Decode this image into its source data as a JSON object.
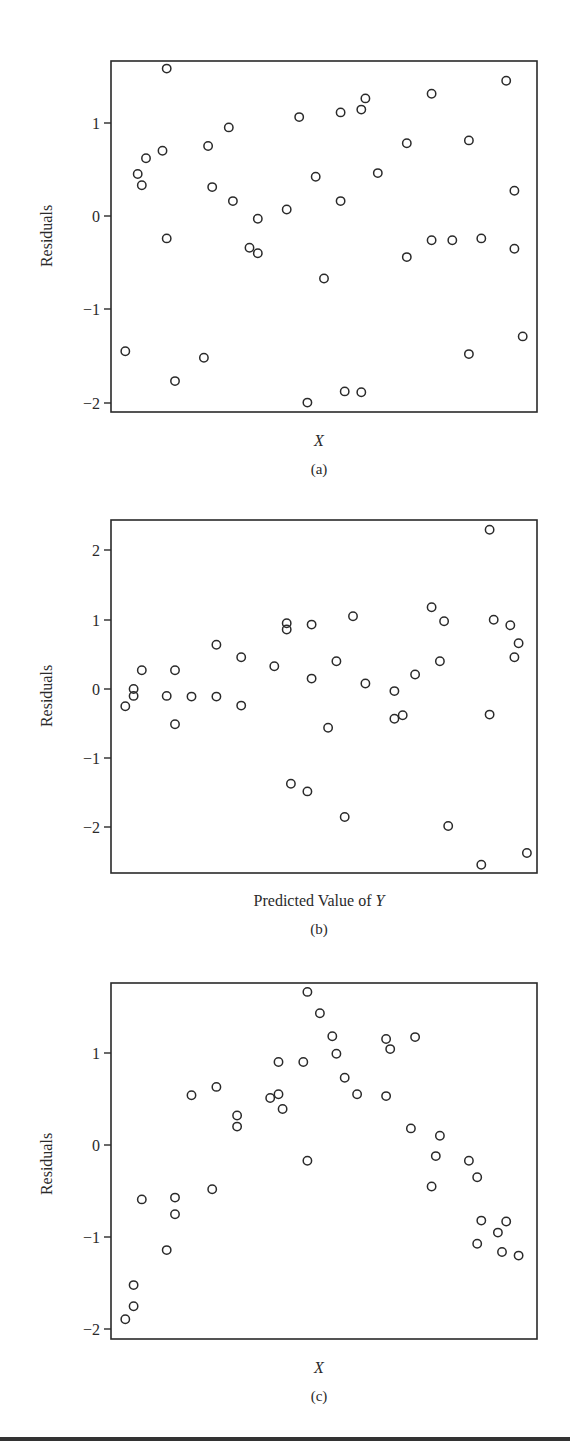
{
  "chart_data": [
    {
      "id": "a",
      "type": "scatter",
      "title": "",
      "caption": "(a)",
      "xlabel": "X",
      "xlabel_italic": true,
      "ylabel": "Residuals",
      "ylim": [
        -2.1,
        1.65
      ],
      "yticks": [
        1,
        0,
        -1,
        -2
      ],
      "ytick_labels": [
        "1",
        "0",
        "−1",
        "−2"
      ],
      "grid": false,
      "legend": null,
      "marker": "open-circle",
      "points": [
        {
          "x": 0.02,
          "y": -1.45
        },
        {
          "x": 0.05,
          "y": 0.45
        },
        {
          "x": 0.06,
          "y": 0.33
        },
        {
          "x": 0.07,
          "y": 0.62
        },
        {
          "x": 0.11,
          "y": 0.7
        },
        {
          "x": 0.12,
          "y": 1.58
        },
        {
          "x": 0.12,
          "y": -0.24
        },
        {
          "x": 0.14,
          "y": -1.77
        },
        {
          "x": 0.21,
          "y": -1.52
        },
        {
          "x": 0.22,
          "y": 0.75
        },
        {
          "x": 0.23,
          "y": 0.31
        },
        {
          "x": 0.27,
          "y": 0.95
        },
        {
          "x": 0.28,
          "y": 0.16
        },
        {
          "x": 0.32,
          "y": -0.34
        },
        {
          "x": 0.34,
          "y": -0.03
        },
        {
          "x": 0.34,
          "y": -0.4
        },
        {
          "x": 0.41,
          "y": 0.07
        },
        {
          "x": 0.44,
          "y": 1.06
        },
        {
          "x": 0.46,
          "y": -2.0
        },
        {
          "x": 0.48,
          "y": 0.42
        },
        {
          "x": 0.5,
          "y": -0.67
        },
        {
          "x": 0.54,
          "y": 1.11
        },
        {
          "x": 0.54,
          "y": 0.16
        },
        {
          "x": 0.55,
          "y": -1.88
        },
        {
          "x": 0.59,
          "y": -1.89
        },
        {
          "x": 0.59,
          "y": 1.14
        },
        {
          "x": 0.6,
          "y": 1.26
        },
        {
          "x": 0.63,
          "y": 0.46
        },
        {
          "x": 0.7,
          "y": 0.78
        },
        {
          "x": 0.7,
          "y": -0.44
        },
        {
          "x": 0.76,
          "y": 1.31
        },
        {
          "x": 0.76,
          "y": -0.26
        },
        {
          "x": 0.81,
          "y": -0.26
        },
        {
          "x": 0.85,
          "y": 0.81
        },
        {
          "x": 0.85,
          "y": -1.48
        },
        {
          "x": 0.88,
          "y": -0.24
        },
        {
          "x": 0.94,
          "y": 1.45
        },
        {
          "x": 0.96,
          "y": 0.27
        },
        {
          "x": 0.96,
          "y": -0.35
        },
        {
          "x": 0.98,
          "y": -1.29
        }
      ]
    },
    {
      "id": "b",
      "type": "scatter",
      "title": "",
      "caption": "(b)",
      "xlabel": "Predicted Value of Y",
      "xlabel_parts": [
        "Predicted Value of ",
        "Y"
      ],
      "ylabel": "Residuals",
      "ylim": [
        -2.65,
        2.4
      ],
      "yticks": [
        2,
        1,
        0,
        -1,
        -2
      ],
      "ytick_labels": [
        "2",
        "1",
        "0",
        "−1",
        "−2"
      ],
      "grid": false,
      "legend": null,
      "marker": "open-circle",
      "points": [
        {
          "x": 0.02,
          "y": -0.25
        },
        {
          "x": 0.04,
          "y": 0.0
        },
        {
          "x": 0.04,
          "y": -0.1
        },
        {
          "x": 0.06,
          "y": 0.27
        },
        {
          "x": 0.12,
          "y": -0.1
        },
        {
          "x": 0.14,
          "y": 0.27
        },
        {
          "x": 0.14,
          "y": -0.51
        },
        {
          "x": 0.18,
          "y": -0.11
        },
        {
          "x": 0.24,
          "y": 0.64
        },
        {
          "x": 0.24,
          "y": -0.11
        },
        {
          "x": 0.3,
          "y": 0.46
        },
        {
          "x": 0.3,
          "y": -0.24
        },
        {
          "x": 0.38,
          "y": 0.33
        },
        {
          "x": 0.41,
          "y": 0.95
        },
        {
          "x": 0.41,
          "y": 0.86
        },
        {
          "x": 0.42,
          "y": -1.37
        },
        {
          "x": 0.46,
          "y": -1.48
        },
        {
          "x": 0.47,
          "y": 0.93
        },
        {
          "x": 0.47,
          "y": 0.15
        },
        {
          "x": 0.51,
          "y": -0.56
        },
        {
          "x": 0.53,
          "y": 0.4
        },
        {
          "x": 0.55,
          "y": -1.85
        },
        {
          "x": 0.57,
          "y": 1.05
        },
        {
          "x": 0.6,
          "y": 0.08
        },
        {
          "x": 0.67,
          "y": -0.03
        },
        {
          "x": 0.67,
          "y": -0.43
        },
        {
          "x": 0.69,
          "y": -0.38
        },
        {
          "x": 0.72,
          "y": 0.21
        },
        {
          "x": 0.76,
          "y": 1.18
        },
        {
          "x": 0.78,
          "y": 0.4
        },
        {
          "x": 0.79,
          "y": 0.98
        },
        {
          "x": 0.8,
          "y": -1.98
        },
        {
          "x": 0.88,
          "y": -2.54
        },
        {
          "x": 0.9,
          "y": 2.3
        },
        {
          "x": 0.9,
          "y": -0.37
        },
        {
          "x": 0.91,
          "y": 1.0
        },
        {
          "x": 0.95,
          "y": 0.92
        },
        {
          "x": 0.96,
          "y": 0.46
        },
        {
          "x": 0.97,
          "y": 0.66
        },
        {
          "x": 0.99,
          "y": -2.37
        }
      ]
    },
    {
      "id": "c",
      "type": "scatter",
      "title": "",
      "caption": "(c)",
      "xlabel": "X",
      "xlabel_italic": true,
      "ylabel": "Residuals",
      "ylim": [
        -2.1,
        1.75
      ],
      "yticks": [
        1,
        0,
        -1,
        -2
      ],
      "ytick_labels": [
        "1",
        "0",
        "−1",
        "−2"
      ],
      "grid": false,
      "legend": null,
      "marker": "open-circle",
      "points": [
        {
          "x": 0.02,
          "y": -1.89
        },
        {
          "x": 0.04,
          "y": -1.75
        },
        {
          "x": 0.04,
          "y": -1.52
        },
        {
          "x": 0.06,
          "y": -0.59
        },
        {
          "x": 0.12,
          "y": -1.14
        },
        {
          "x": 0.14,
          "y": -0.75
        },
        {
          "x": 0.14,
          "y": -0.57
        },
        {
          "x": 0.18,
          "y": 0.54
        },
        {
          "x": 0.23,
          "y": -0.48
        },
        {
          "x": 0.24,
          "y": 0.63
        },
        {
          "x": 0.29,
          "y": 0.32
        },
        {
          "x": 0.29,
          "y": 0.2
        },
        {
          "x": 0.37,
          "y": 0.51
        },
        {
          "x": 0.39,
          "y": 0.9
        },
        {
          "x": 0.39,
          "y": 0.55
        },
        {
          "x": 0.4,
          "y": 0.39
        },
        {
          "x": 0.45,
          "y": 0.9
        },
        {
          "x": 0.46,
          "y": 1.66
        },
        {
          "x": 0.46,
          "y": -0.17
        },
        {
          "x": 0.49,
          "y": 1.43
        },
        {
          "x": 0.52,
          "y": 1.18
        },
        {
          "x": 0.53,
          "y": 0.99
        },
        {
          "x": 0.55,
          "y": 0.73
        },
        {
          "x": 0.58,
          "y": 0.55
        },
        {
          "x": 0.65,
          "y": 1.15
        },
        {
          "x": 0.65,
          "y": 0.53
        },
        {
          "x": 0.66,
          "y": 1.04
        },
        {
          "x": 0.72,
          "y": 1.17
        },
        {
          "x": 0.71,
          "y": 0.18
        },
        {
          "x": 0.76,
          "y": -0.45
        },
        {
          "x": 0.77,
          "y": -0.12
        },
        {
          "x": 0.78,
          "y": 0.1
        },
        {
          "x": 0.85,
          "y": -0.17
        },
        {
          "x": 0.87,
          "y": -0.35
        },
        {
          "x": 0.87,
          "y": -1.07
        },
        {
          "x": 0.88,
          "y": -0.82
        },
        {
          "x": 0.92,
          "y": -0.95
        },
        {
          "x": 0.93,
          "y": -1.16
        },
        {
          "x": 0.94,
          "y": -0.83
        },
        {
          "x": 0.97,
          "y": -1.2
        }
      ]
    }
  ],
  "panels": {
    "a": {
      "caption": "(a)",
      "xlabel": "X",
      "ylabel": "Residuals",
      "ticks": [
        "1",
        "0",
        "−1",
        "−2"
      ]
    },
    "b": {
      "caption": "(b)",
      "xlabel_prefix": "Predicted Value of ",
      "xlabel_var": "Y",
      "ylabel": "Residuals",
      "ticks": [
        "2",
        "1",
        "0",
        "−1",
        "−2"
      ]
    },
    "c": {
      "caption": "(c)",
      "xlabel": "X",
      "ylabel": "Residuals",
      "ticks": [
        "1",
        "0",
        "−1",
        "−2"
      ]
    }
  },
  "colors": {
    "ink": "#2a2a2a",
    "background": "#ffffff",
    "rule": "#333333"
  }
}
